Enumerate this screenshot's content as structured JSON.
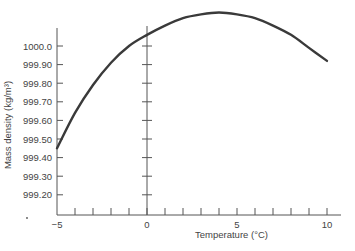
{
  "chart_data": {
    "type": "line",
    "title": "",
    "xlabel": "Temperature (°C)",
    "ylabel": "Mass density (kg/m³)",
    "xlim": [
      -5,
      10
    ],
    "ylim": [
      999.1,
      1000.2
    ],
    "grid": false,
    "legend": null,
    "x_ticks": [
      -5,
      0,
      5,
      10
    ],
    "x_tick_labels": [
      "−5",
      "0",
      "5",
      "10"
    ],
    "x_minor_ticks_per_unit": 1,
    "y_tick_labels": [
      "1000.0",
      "999.90",
      "999.80",
      "999.70",
      "999.60",
      "999.50",
      "999.40",
      "999.30",
      "999.20"
    ],
    "y_ticks": [
      1000.0,
      999.9,
      999.8,
      999.7,
      999.6,
      999.5,
      999.4,
      999.3,
      999.2
    ],
    "series": [
      {
        "name": "Water density",
        "x": [
          -5,
          -4,
          -3,
          -2,
          -1,
          0,
          1,
          2,
          3,
          4,
          5,
          6,
          7,
          8,
          9,
          10
        ],
        "y": [
          999.45,
          999.64,
          999.79,
          999.91,
          1000.0,
          1000.06,
          1000.11,
          1000.15,
          1000.17,
          1000.18,
          1000.17,
          1000.15,
          1000.11,
          1000.06,
          999.99,
          999.92
        ]
      }
    ],
    "annotations": [
      "secondary vertical tick axis at x = 0"
    ]
  },
  "axis": {
    "x_title": "Temperature (°C)",
    "y_title": "Mass density (kg/m³)"
  }
}
